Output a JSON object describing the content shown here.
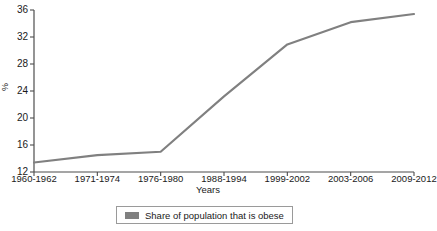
{
  "chart_data": {
    "type": "line",
    "title": "",
    "clipped_title_fragment": "",
    "xlabel": "Years",
    "ylabel": "%",
    "categories": [
      "1960-1962",
      "1971-1974",
      "1976-1980",
      "1988-1994",
      "1999-2002",
      "2003-2006",
      "2009-2012"
    ],
    "values": [
      13.4,
      14.5,
      15.0,
      23.2,
      30.9,
      34.2,
      35.4
    ],
    "series": [
      {
        "name": "Share of population that is obese",
        "values": [
          13.4,
          14.5,
          15.0,
          23.2,
          30.9,
          34.2,
          35.4
        ],
        "color": "#808080"
      }
    ],
    "ylim": [
      12,
      36
    ],
    "yticks": [
      12,
      16,
      20,
      24,
      28,
      32,
      36
    ],
    "ytick_labels": [
      "12",
      "16",
      "20",
      "24",
      "28",
      "32",
      "36"
    ],
    "grid": false,
    "legend_position": "bottom"
  },
  "legend": {
    "entries": [
      {
        "label": "Share of population that is obese",
        "color": "#808080"
      }
    ]
  },
  "axes": {
    "y_title": "%",
    "x_title": "Years"
  },
  "colors": {
    "line": "#808080",
    "axis": "#4d4d4d",
    "text": "#1a1a1a",
    "legend_border": "#9a9a9a",
    "background": "#ffffff"
  }
}
